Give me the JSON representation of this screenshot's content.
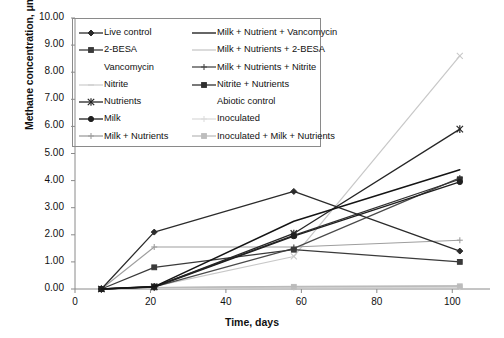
{
  "chart_data": {
    "type": "line",
    "title": "",
    "xlabel": "Time, days",
    "ylabel": "Methane concentration, μmol/kg",
    "xlim": [
      0,
      110
    ],
    "ylim": [
      0,
      10
    ],
    "xticks": [
      "0",
      "20",
      "40",
      "60",
      "80",
      "100"
    ],
    "yticks": [
      "0.00",
      "1.00",
      "2.00",
      "3.00",
      "4.00",
      "5.00",
      "6.00",
      "7.00",
      "8.00",
      "9.00",
      "10.00"
    ],
    "grid": false,
    "legend_position": "upper-left-inside",
    "x": [
      7,
      21,
      58,
      102
    ],
    "series": [
      {
        "name": "Live control",
        "values": [
          0.0,
          2.1,
          3.6,
          1.4
        ],
        "color": "#2b2b2b",
        "marker": "diamond",
        "width": 1.3
      },
      {
        "name": "2-BESA",
        "values": [
          0.0,
          0.8,
          1.45,
          1.0
        ],
        "color": "#3a3a3a",
        "marker": "square",
        "width": 1.3
      },
      {
        "name": "Vancomycin",
        "values": [
          0.0,
          0.06,
          0.1,
          0.12
        ],
        "color": "#b9b9b9",
        "marker": "none",
        "width": 1.0
      },
      {
        "name": "Nitrite",
        "values": [
          0.0,
          0.05,
          0.09,
          0.11
        ],
        "color": "#cfcfcf",
        "marker": "dash",
        "width": 1.0
      },
      {
        "name": "Nutrients",
        "values": [
          0.0,
          0.08,
          2.05,
          5.9
        ],
        "color": "#262626",
        "marker": "star",
        "width": 1.3
      },
      {
        "name": "Milk",
        "values": [
          0.0,
          0.07,
          1.95,
          3.95
        ],
        "color": "#1f1f1f",
        "marker": "circle",
        "width": 1.3
      },
      {
        "name": "Milk + Nutrients",
        "values": [
          0.0,
          1.55,
          1.55,
          1.8
        ],
        "color": "#9e9e9e",
        "marker": "plus",
        "width": 1.1
      },
      {
        "name": "Milk + Nutrient + Vancomycin",
        "values": [
          0.0,
          0.09,
          2.5,
          4.4
        ],
        "color": "#141414",
        "marker": "none",
        "width": 1.4
      },
      {
        "name": "Milk + Nutrients + 2-BESA",
        "values": [
          0.0,
          0.1,
          1.2,
          8.6
        ],
        "color": "#c8c8c8",
        "marker": "x",
        "width": 1.2
      },
      {
        "name": "Milk + Nutrients + Nitrite",
        "values": [
          0.0,
          0.08,
          1.5,
          4.1
        ],
        "color": "#4a4a4a",
        "marker": "plus",
        "width": 1.2
      },
      {
        "name": "Nitrite + Nutrients",
        "values": [
          0.0,
          0.09,
          1.98,
          4.05
        ],
        "color": "#303030",
        "marker": "square",
        "width": 1.3
      },
      {
        "name": "Abiotic control",
        "values": [
          0.0,
          0.04,
          0.06,
          0.07
        ],
        "color": "#d2d2d2",
        "marker": "none",
        "width": 1.0
      },
      {
        "name": "Inoculated",
        "values": [
          0.0,
          0.03,
          0.05,
          0.06
        ],
        "color": "#dcdcdc",
        "marker": "plus",
        "width": 1.0
      },
      {
        "name": "Inoculated + Milk + Nutrients",
        "values": [
          0.0,
          0.05,
          0.08,
          0.1
        ],
        "color": "#bdbdbd",
        "marker": "square",
        "width": 1.0
      }
    ]
  },
  "legend": {
    "column_left": [
      {
        "label": "Live control",
        "marker": "diamond",
        "color": "#2b2b2b",
        "line": true
      },
      {
        "label": "2-BESA",
        "marker": "square",
        "color": "#3a3a3a",
        "line": true
      },
      {
        "label": "Vancomycin",
        "marker": "none",
        "color": "#ffffff",
        "line": false
      },
      {
        "label": "Nitrite",
        "marker": "dash",
        "color": "#cfcfcf",
        "line": true
      },
      {
        "label": "Nutrients",
        "marker": "star",
        "color": "#262626",
        "line": true
      },
      {
        "label": "Milk",
        "marker": "circle",
        "color": "#1f1f1f",
        "line": true
      },
      {
        "label": "Milk + Nutrients",
        "marker": "plus",
        "color": "#9e9e9e",
        "line": true
      }
    ],
    "column_right": [
      {
        "label": "Milk + Nutrient + Vancomycin",
        "marker": "none",
        "color": "#141414",
        "line": true
      },
      {
        "label": "Milk + Nutrients + 2-BESA",
        "marker": "none",
        "color": "#c8c8c8",
        "line": true
      },
      {
        "label": "Milk + Nutrients + Nitrite",
        "marker": "plus",
        "color": "#4a4a4a",
        "line": true
      },
      {
        "label": "Nitrite + Nutrients",
        "marker": "square",
        "color": "#303030",
        "line": true
      },
      {
        "label": "Abiotic control",
        "marker": "none",
        "color": "#ffffff",
        "line": false
      },
      {
        "label": "Inoculated",
        "marker": "plus",
        "color": "#dcdcdc",
        "line": true
      },
      {
        "label": "Inoculated + Milk + Nutrients",
        "marker": "square",
        "color": "#bdbdbd",
        "line": true
      }
    ]
  },
  "axes": {
    "axis_color": "#8a8a8a",
    "text_color": "#111111"
  }
}
